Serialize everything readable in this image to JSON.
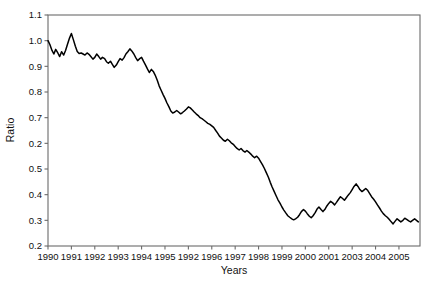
{
  "figure": {
    "title": "",
    "background_color": "#ffffff",
    "line_color": "#000000",
    "axis_color": "#6b6b6b",
    "text_color": "#111111"
  },
  "chart_data": {
    "type": "line",
    "title": "",
    "subtitle": "",
    "xlabel": "Years",
    "ylabel": "Ratio",
    "grid": false,
    "legend": null,
    "legend_position": "none",
    "xlim": [
      1990,
      2005.9
    ],
    "ylim": [
      0.2,
      1.1
    ],
    "x_tick_labels": [
      "1990",
      "1991",
      "1992",
      "1993",
      "1994",
      "1995",
      "1992",
      "1996",
      "1997",
      "1998",
      "1999",
      "2000",
      "2001",
      "2003",
      "2004",
      "2005"
    ],
    "x_tick_positions": [
      1990,
      1991,
      1992,
      1993,
      1994,
      1995,
      1996,
      1997,
      1998,
      1999,
      2000,
      2001,
      2002,
      2003,
      2004,
      2005
    ],
    "y_tick_labels": [
      "1.1",
      "1.0",
      "0.9",
      "0.8",
      "0.7",
      "0.2",
      "0.5",
      "0.4",
      "0.3",
      "0.2"
    ],
    "y_tick_positions": [
      1.1,
      1.0,
      0.9,
      0.8,
      0.7,
      0.6,
      0.5,
      0.4,
      0.3,
      0.2
    ],
    "series": [
      {
        "name": "Ratio",
        "color": "#000000",
        "x": [
          1990.0,
          1990.08,
          1990.17,
          1990.25,
          1990.33,
          1990.42,
          1990.5,
          1990.58,
          1990.67,
          1990.75,
          1990.83,
          1990.92,
          1991.0,
          1991.08,
          1991.17,
          1991.25,
          1991.33,
          1991.42,
          1991.5,
          1991.58,
          1991.67,
          1991.75,
          1991.83,
          1991.92,
          1992.0,
          1992.08,
          1992.17,
          1992.25,
          1992.33,
          1992.42,
          1992.5,
          1992.58,
          1992.67,
          1992.75,
          1992.83,
          1992.92,
          1993.0,
          1993.08,
          1993.17,
          1993.25,
          1993.33,
          1993.42,
          1993.5,
          1993.58,
          1993.67,
          1993.75,
          1993.83,
          1993.92,
          1994.0,
          1994.08,
          1994.17,
          1994.25,
          1994.33,
          1994.42,
          1994.5,
          1994.58,
          1994.67,
          1994.75,
          1994.83,
          1994.92,
          1995.0,
          1995.08,
          1995.17,
          1995.25,
          1995.33,
          1995.42,
          1995.5,
          1995.58,
          1995.67,
          1995.75,
          1995.83,
          1995.92,
          1996.0,
          1996.08,
          1996.17,
          1996.25,
          1996.33,
          1996.42,
          1996.5,
          1996.58,
          1996.67,
          1996.75,
          1996.83,
          1996.92,
          1997.0,
          1997.08,
          1997.17,
          1997.25,
          1997.33,
          1997.42,
          1997.5,
          1997.58,
          1997.67,
          1997.75,
          1997.83,
          1997.92,
          1998.0,
          1998.08,
          1998.17,
          1998.25,
          1998.33,
          1998.42,
          1998.5,
          1998.58,
          1998.67,
          1998.75,
          1998.83,
          1998.92,
          1999.0,
          1999.08,
          1999.17,
          1999.25,
          1999.33,
          1999.42,
          1999.5,
          1999.58,
          1999.67,
          1999.75,
          1999.83,
          1999.92,
          2000.0,
          2000.08,
          2000.17,
          2000.25,
          2000.33,
          2000.42,
          2000.5,
          2000.58,
          2000.67,
          2000.75,
          2000.83,
          2000.92,
          2001.0,
          2001.08,
          2001.17,
          2001.25,
          2001.33,
          2001.42,
          2001.5,
          2001.58,
          2001.67,
          2001.75,
          2001.83,
          2001.92,
          2002.0,
          2002.08,
          2002.17,
          2002.25,
          2002.33,
          2002.42,
          2002.5,
          2002.58,
          2002.67,
          2002.75,
          2002.83,
          2002.92,
          2003.0,
          2003.08,
          2003.17,
          2003.25,
          2003.33,
          2003.42,
          2003.5,
          2003.58,
          2003.67,
          2003.75,
          2003.83,
          2003.92,
          2004.0,
          2004.08,
          2004.17,
          2004.25,
          2004.33,
          2004.42,
          2004.5,
          2004.58,
          2004.67,
          2004.75,
          2004.83,
          2004.92,
          2005.0,
          2005.08,
          2005.17,
          2005.25,
          2005.33,
          2005.42,
          2005.5,
          2005.58,
          2005.67,
          2005.75,
          2005.83
        ],
        "values": [
          1.0,
          0.985,
          0.962,
          0.948,
          0.966,
          0.952,
          0.938,
          0.957,
          0.944,
          0.962,
          0.985,
          1.01,
          1.028,
          1.005,
          0.978,
          0.958,
          0.95,
          0.952,
          0.948,
          0.944,
          0.952,
          0.947,
          0.938,
          0.928,
          0.935,
          0.948,
          0.938,
          0.928,
          0.935,
          0.93,
          0.918,
          0.912,
          0.92,
          0.908,
          0.896,
          0.905,
          0.918,
          0.93,
          0.924,
          0.934,
          0.948,
          0.958,
          0.968,
          0.96,
          0.948,
          0.934,
          0.922,
          0.93,
          0.935,
          0.92,
          0.905,
          0.89,
          0.876,
          0.888,
          0.88,
          0.866,
          0.846,
          0.824,
          0.808,
          0.79,
          0.775,
          0.758,
          0.742,
          0.726,
          0.718,
          0.722,
          0.728,
          0.722,
          0.715,
          0.72,
          0.726,
          0.734,
          0.742,
          0.738,
          0.73,
          0.722,
          0.715,
          0.708,
          0.7,
          0.696,
          0.69,
          0.684,
          0.678,
          0.674,
          0.668,
          0.662,
          0.65,
          0.64,
          0.628,
          0.62,
          0.612,
          0.608,
          0.616,
          0.61,
          0.602,
          0.596,
          0.588,
          0.58,
          0.574,
          0.58,
          0.572,
          0.566,
          0.572,
          0.566,
          0.558,
          0.55,
          0.544,
          0.55,
          0.542,
          0.53,
          0.516,
          0.502,
          0.486,
          0.468,
          0.448,
          0.43,
          0.412,
          0.396,
          0.38,
          0.366,
          0.352,
          0.34,
          0.328,
          0.318,
          0.312,
          0.306,
          0.302,
          0.306,
          0.312,
          0.322,
          0.334,
          0.342,
          0.336,
          0.326,
          0.316,
          0.31,
          0.318,
          0.33,
          0.344,
          0.352,
          0.342,
          0.334,
          0.342,
          0.356,
          0.366,
          0.374,
          0.368,
          0.36,
          0.37,
          0.382,
          0.392,
          0.386,
          0.378,
          0.388,
          0.398,
          0.408,
          0.42,
          0.432,
          0.442,
          0.432,
          0.42,
          0.412,
          0.418,
          0.424,
          0.416,
          0.404,
          0.392,
          0.382,
          0.372,
          0.36,
          0.348,
          0.336,
          0.326,
          0.318,
          0.312,
          0.304,
          0.294,
          0.286,
          0.296,
          0.306,
          0.3,
          0.294,
          0.3,
          0.308,
          0.304,
          0.298,
          0.294,
          0.3,
          0.306,
          0.3,
          0.294
        ]
      }
    ]
  }
}
